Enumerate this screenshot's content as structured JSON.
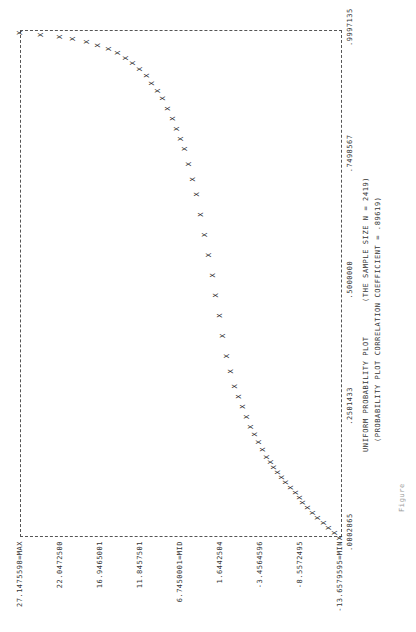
{
  "chart_data": {
    "type": "scatter",
    "title": "UNIFORM PROBABILITY PLOT",
    "subtitle": "(THE SAMPLE SIZE N = 2419)",
    "annotation": "(PROBABILITY PLOT CORRELATION COEFFICIENT = .89619)",
    "xlabel": "",
    "ylabel": "",
    "x_tick_labels": [
      ".0002865",
      ".2501433",
      ".5000000",
      ".7498567",
      ".9997135"
    ],
    "x_ticks": [
      0.0002865,
      0.2501433,
      0.5,
      0.7498567,
      0.9997135
    ],
    "y_tick_labels": [
      "27.1475598=MAX",
      "22.0472500",
      "16.9465001",
      "11.8457501",
      "6.7450001=MID",
      "1.6442504",
      "-3.4564596",
      "-8.5572495",
      "-13.6579595=MIN"
    ],
    "y_ticks": [
      27.1475598,
      22.04725,
      16.9465001,
      11.8457501,
      6.7450001,
      1.6442504,
      -3.4564596,
      -8.5572495,
      -13.6579595
    ],
    "xlim": [
      0.0002865,
      0.9997135
    ],
    "ylim": [
      -13.6579595,
      27.1475598
    ],
    "grid": false,
    "legend": "none",
    "marker": "X",
    "points": [
      {
        "x": 0.0,
        "y": -13.66
      },
      {
        "x": 0.01,
        "y": -13.0
      },
      {
        "x": 0.02,
        "y": -12.3
      },
      {
        "x": 0.03,
        "y": -11.6
      },
      {
        "x": 0.04,
        "y": -10.9
      },
      {
        "x": 0.05,
        "y": -10.2
      },
      {
        "x": 0.06,
        "y": -9.6
      },
      {
        "x": 0.07,
        "y": -9.0
      },
      {
        "x": 0.08,
        "y": -8.5
      },
      {
        "x": 0.09,
        "y": -8.0
      },
      {
        "x": 0.1,
        "y": -7.4
      },
      {
        "x": 0.11,
        "y": -6.8
      },
      {
        "x": 0.12,
        "y": -6.3
      },
      {
        "x": 0.13,
        "y": -5.8
      },
      {
        "x": 0.14,
        "y": -5.3
      },
      {
        "x": 0.15,
        "y": -4.8
      },
      {
        "x": 0.16,
        "y": -4.3
      },
      {
        "x": 0.175,
        "y": -3.8
      },
      {
        "x": 0.19,
        "y": -3.3
      },
      {
        "x": 0.205,
        "y": -2.8
      },
      {
        "x": 0.22,
        "y": -2.3
      },
      {
        "x": 0.24,
        "y": -1.8
      },
      {
        "x": 0.26,
        "y": -1.3
      },
      {
        "x": 0.28,
        "y": -0.8
      },
      {
        "x": 0.3,
        "y": -0.3
      },
      {
        "x": 0.33,
        "y": 0.2
      },
      {
        "x": 0.36,
        "y": 0.7
      },
      {
        "x": 0.4,
        "y": 1.2
      },
      {
        "x": 0.44,
        "y": 1.6
      },
      {
        "x": 0.48,
        "y": 2.1
      },
      {
        "x": 0.52,
        "y": 2.6
      },
      {
        "x": 0.56,
        "y": 3.1
      },
      {
        "x": 0.6,
        "y": 3.6
      },
      {
        "x": 0.64,
        "y": 4.1
      },
      {
        "x": 0.68,
        "y": 4.6
      },
      {
        "x": 0.71,
        "y": 5.1
      },
      {
        "x": 0.74,
        "y": 5.6
      },
      {
        "x": 0.77,
        "y": 6.1
      },
      {
        "x": 0.79,
        "y": 6.6
      },
      {
        "x": 0.81,
        "y": 7.1
      },
      {
        "x": 0.83,
        "y": 7.7
      },
      {
        "x": 0.85,
        "y": 8.3
      },
      {
        "x": 0.87,
        "y": 8.9
      },
      {
        "x": 0.885,
        "y": 9.6
      },
      {
        "x": 0.9,
        "y": 10.3
      },
      {
        "x": 0.915,
        "y": 11.0
      },
      {
        "x": 0.928,
        "y": 11.8
      },
      {
        "x": 0.94,
        "y": 12.7
      },
      {
        "x": 0.95,
        "y": 13.6
      },
      {
        "x": 0.96,
        "y": 14.6
      },
      {
        "x": 0.968,
        "y": 15.8
      },
      {
        "x": 0.975,
        "y": 17.2
      },
      {
        "x": 0.982,
        "y": 18.6
      },
      {
        "x": 0.988,
        "y": 20.4
      },
      {
        "x": 0.992,
        "y": 22.0
      },
      {
        "x": 0.996,
        "y": 24.5
      },
      {
        "x": 0.9997,
        "y": 27.15
      }
    ]
  },
  "figure_caption": "Figure"
}
